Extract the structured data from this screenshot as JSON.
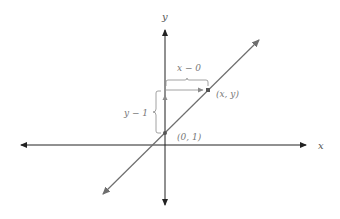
{
  "diagram": {
    "axes": {
      "x_label": "x",
      "y_label": "y",
      "color": "#222222"
    },
    "line": {
      "color": "#6e6e6e",
      "description": "line through (0, 1) and (x, y)"
    },
    "points": [
      {
        "label": "(0, 1)",
        "color": "#555555"
      },
      {
        "label": "(x, y)",
        "color": "#555555"
      }
    ],
    "annotations": {
      "horizontal_run": "x − 0",
      "vertical_rise": "y − 1",
      "color": "#8a8a8a"
    }
  }
}
